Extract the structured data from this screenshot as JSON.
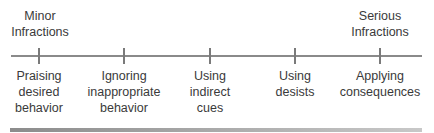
{
  "diagram": {
    "type": "continuum",
    "left_anchor": {
      "line1": "Minor",
      "line2": "Infractions"
    },
    "right_anchor": {
      "line1": "Serious",
      "line2": "Infractions"
    },
    "points": [
      {
        "line1": "Praising",
        "line2": "desired",
        "line3": "behavior"
      },
      {
        "line1": "Ignoring",
        "line2": "inappropriate",
        "line3": "behavior"
      },
      {
        "line1": "Using",
        "line2": "indirect",
        "line3": "cues"
      },
      {
        "line1": "Using",
        "line2": "desists",
        "line3": ""
      },
      {
        "line1": "Applying",
        "line2": "consequences",
        "line3": ""
      }
    ],
    "colors": {
      "text": "#3a3a3a",
      "line": "#8a8a8a",
      "bar": "#a0a0a0"
    }
  }
}
